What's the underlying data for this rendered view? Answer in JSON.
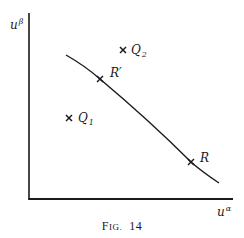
{
  "figure": {
    "caption_prefix": "F",
    "caption_smallcaps": "ig.",
    "caption_number": "14",
    "axes": {
      "y_label_base": "u",
      "y_label_sup": "β",
      "x_label_base": "u",
      "x_label_sup": "α"
    },
    "points": [
      {
        "id": "Q2",
        "base": "Q",
        "sub": "2",
        "marker": "x",
        "on_curve": false
      },
      {
        "id": "R_prime",
        "base": "R′",
        "sub": "",
        "marker": "x",
        "on_curve": true
      },
      {
        "id": "Q1",
        "base": "Q",
        "sub": "1",
        "marker": "x",
        "on_curve": false
      },
      {
        "id": "R",
        "base": "R",
        "sub": "",
        "marker": "x",
        "on_curve": true
      }
    ],
    "curve": {
      "description": "decreasing curve from upper-left to lower-right passing through R′ and R"
    },
    "colors": {
      "ink": "#1a1a1a",
      "background": "#ffffff"
    }
  }
}
